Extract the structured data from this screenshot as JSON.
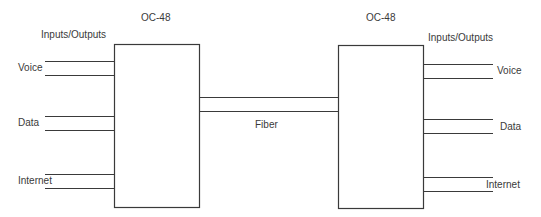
{
  "diagram": {
    "left_node": {
      "title": "OC-48",
      "io_heading": "Inputs/Outputs",
      "ports": [
        {
          "label": "Voice"
        },
        {
          "label": "Data"
        },
        {
          "label": "Internet"
        }
      ]
    },
    "right_node": {
      "title": "OC-48",
      "io_heading": "Inputs/Outputs",
      "ports": [
        {
          "label": "Voice"
        },
        {
          "label": "Data"
        },
        {
          "label": "Internet"
        }
      ]
    },
    "link": {
      "label": "Fiber"
    },
    "colors": {
      "line": "#3a3a3a",
      "background": "#ffffff"
    }
  }
}
